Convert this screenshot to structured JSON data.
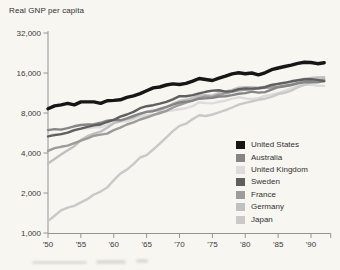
{
  "figure": {
    "title": "Real GNP per capita"
  },
  "chart_data": {
    "type": "line",
    "title": "Real GNP per capita",
    "y_axis": {
      "scale": "log2",
      "range": [
        1000,
        32000
      ],
      "ticks": [
        {
          "label": "32,000",
          "value": 32000
        },
        {
          "label": "16,000",
          "value": 16000
        },
        {
          "label": "8,000",
          "value": 8000
        },
        {
          "label": "4,000",
          "value": 4000
        },
        {
          "label": "2,000",
          "value": 2000
        },
        {
          "label": "1,000",
          "value": 1000
        }
      ]
    },
    "x_axis": {
      "range": [
        1950,
        1993
      ],
      "ticks": [
        {
          "label": "'50",
          "year": 1950
        },
        {
          "label": "'55",
          "year": 1955
        },
        {
          "label": "'60",
          "year": 1960
        },
        {
          "label": "'65",
          "year": 1965
        },
        {
          "label": "'70",
          "year": 1970
        },
        {
          "label": "'75",
          "year": 1975
        },
        {
          "label": "'80",
          "year": 1980
        },
        {
          "label": "'85",
          "year": 1985
        },
        {
          "label": "'90",
          "year": 1990
        }
      ],
      "end_tick_year": 1993
    },
    "years": [
      1950,
      1951,
      1952,
      1953,
      1954,
      1955,
      1956,
      1957,
      1958,
      1959,
      1960,
      1961,
      1962,
      1963,
      1964,
      1965,
      1966,
      1967,
      1968,
      1969,
      1970,
      1971,
      1972,
      1973,
      1974,
      1975,
      1976,
      1977,
      1978,
      1979,
      1980,
      1981,
      1982,
      1983,
      1984,
      1985,
      1986,
      1987,
      1988,
      1989,
      1990,
      1991,
      1992
    ],
    "legend_position": "right-middle",
    "series": [
      {
        "name": "United States",
        "color": "#161616",
        "width": 3.4,
        "values": [
          8600,
          9050,
          9200,
          9450,
          9200,
          9700,
          9700,
          9700,
          9450,
          9900,
          9950,
          10050,
          10500,
          10750,
          11200,
          11750,
          12350,
          12550,
          13000,
          13250,
          13100,
          13350,
          13900,
          14550,
          14300,
          14050,
          14650,
          15150,
          15750,
          16050,
          15800,
          16000,
          15500,
          16050,
          16950,
          17450,
          17900,
          18350,
          18900,
          19250,
          19200,
          18800,
          19100
        ]
      },
      {
        "name": "Australia",
        "color": "#858585",
        "width": 2.4,
        "values": [
          5950,
          6050,
          6000,
          6150,
          6350,
          6500,
          6550,
          6600,
          6750,
          7000,
          7100,
          7050,
          7300,
          7600,
          7900,
          8150,
          8250,
          8600,
          8900,
          9250,
          9600,
          9750,
          9900,
          10250,
          10300,
          10400,
          10650,
          10700,
          10900,
          11150,
          11300,
          11600,
          11400,
          11500,
          12000,
          12500,
          12700,
          13000,
          13350,
          13600,
          13700,
          13600,
          13900
        ]
      },
      {
        "name": "United Kingdom",
        "color": "#dcdcdc",
        "width": 2.4,
        "values": [
          5400,
          5550,
          5500,
          5700,
          5900,
          6100,
          6150,
          6250,
          6250,
          6450,
          6750,
          6900,
          6950,
          7200,
          7550,
          7700,
          7800,
          7950,
          8250,
          8400,
          8550,
          8700,
          9000,
          9650,
          9500,
          9450,
          9700,
          9900,
          10250,
          10500,
          10300,
          10200,
          10350,
          10750,
          11000,
          11350,
          11750,
          12250,
          12800,
          13050,
          13100,
          12800,
          12800
        ]
      },
      {
        "name": "Sweden",
        "color": "#5f5f5f",
        "width": 2.4,
        "values": [
          5330,
          5450,
          5550,
          5700,
          5950,
          6100,
          6300,
          6450,
          6550,
          6850,
          7100,
          7500,
          7800,
          8150,
          8700,
          9000,
          9150,
          9400,
          9700,
          10150,
          10700,
          10700,
          10900,
          11250,
          11550,
          11800,
          11850,
          11600,
          11700,
          12100,
          12250,
          12200,
          12300,
          12500,
          13000,
          13250,
          13500,
          13850,
          14100,
          14350,
          14400,
          14200,
          13900
        ]
      },
      {
        "name": "France",
        "color": "#9c9c9c",
        "width": 2.4,
        "values": [
          4150,
          4350,
          4450,
          4550,
          4750,
          4950,
          5150,
          5400,
          5500,
          5600,
          5950,
          6200,
          6550,
          6800,
          7150,
          7400,
          7700,
          8000,
          8300,
          8800,
          9200,
          9600,
          9950,
          10400,
          10650,
          10550,
          10950,
          11250,
          11550,
          11850,
          11950,
          12050,
          12300,
          12350,
          12450,
          12600,
          12850,
          13050,
          13500,
          13900,
          14100,
          14150,
          14300
        ]
      },
      {
        "name": "Germany",
        "color": "#c0c0c0",
        "width": 2.4,
        "values": [
          3340,
          3600,
          3900,
          4200,
          4500,
          5000,
          5350,
          5600,
          5800,
          6200,
          6700,
          6950,
          7200,
          7400,
          7800,
          8150,
          8350,
          8350,
          8800,
          9400,
          9850,
          10050,
          10400,
          10850,
          10900,
          10800,
          11350,
          11650,
          11950,
          12400,
          12500,
          12500,
          12400,
          12650,
          13000,
          13250,
          13500,
          13650,
          14100,
          14450,
          14700,
          14800,
          14900
        ]
      },
      {
        "name": "Japan",
        "color": "#c9c9c9",
        "width": 2.4,
        "values": [
          1230,
          1350,
          1480,
          1550,
          1600,
          1700,
          1800,
          1950,
          2050,
          2200,
          2500,
          2800,
          3000,
          3300,
          3700,
          3850,
          4250,
          4700,
          5250,
          5850,
          6400,
          6650,
          7200,
          7700,
          7600,
          7800,
          8100,
          8400,
          8800,
          9250,
          9550,
          9800,
          10050,
          10250,
          10600,
          11100,
          11350,
          11800,
          12500,
          13050,
          13650,
          14000,
          14100
        ]
      }
    ]
  },
  "colors": {
    "background": "#f7f6f1",
    "axis": "#979490",
    "tick_label": "#3b3b3b"
  }
}
